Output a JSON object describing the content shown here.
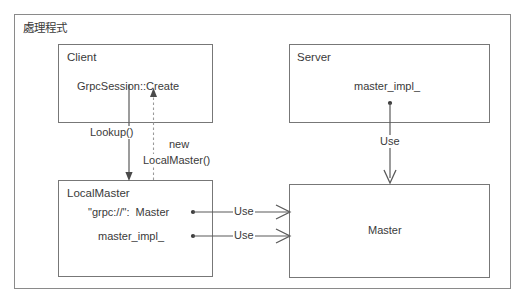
{
  "diagram": {
    "title": "處理程式",
    "background_color": "#ffffff",
    "border_color": "#8a8a8a",
    "text_color": "#3a3a3a",
    "boxes": [
      {
        "id": "client",
        "name": "Client",
        "members": [
          "GrpcSession::Create"
        ]
      },
      {
        "id": "server",
        "name": "Server",
        "members": [
          "master_impl_"
        ]
      },
      {
        "id": "localmaster",
        "name": "LocalMaster",
        "members": [
          "\"grpc://\":  Master",
          "master_impl_"
        ]
      },
      {
        "id": "master",
        "name": "",
        "members": [
          "Master"
        ]
      }
    ],
    "edges": [
      {
        "id": "lookup",
        "label": "Lookup()",
        "from": "client",
        "to": "localmaster",
        "style": "solid",
        "direction": "down"
      },
      {
        "id": "new-localmaster",
        "label": "new\nLocalMaster()",
        "from": "localmaster",
        "to": "client",
        "style": "dashed",
        "direction": "up"
      },
      {
        "id": "server-use",
        "label": "Use",
        "from": "server",
        "to": "master",
        "style": "solid",
        "direction": "down"
      },
      {
        "id": "lm-use-1",
        "label": "Use",
        "from": "localmaster",
        "to": "master",
        "style": "solid",
        "direction": "right"
      },
      {
        "id": "lm-use-2",
        "label": "Use",
        "from": "localmaster",
        "to": "master",
        "style": "solid",
        "direction": "right"
      }
    ],
    "edge_labels": {
      "lookup": "Lookup()",
      "new_line1": "new",
      "new_line2": "LocalMaster()",
      "server_use": "Use",
      "lm_use_1": "Use",
      "lm_use_2": "Use"
    },
    "box_text": {
      "client_name": "Client",
      "client_member_1": "GrpcSession::Create",
      "server_name": "Server",
      "server_member_1": "master_impl_",
      "localmaster_name": "LocalMaster",
      "localmaster_member_1": "\"grpc://\":  Master",
      "localmaster_member_2": "master_impl_",
      "master_label": "Master"
    }
  }
}
